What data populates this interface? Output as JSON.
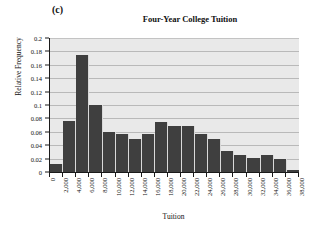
{
  "panel": {
    "label": "(c)"
  },
  "axis_titles": {
    "x": "Tuition",
    "y": "Relative Frequency"
  },
  "chart_data": {
    "type": "bar",
    "title": "Four-Year College Tuition",
    "xlabel": "Tuition",
    "ylabel": "Relative Frequency",
    "ylim": [
      0,
      0.2
    ],
    "grid": true,
    "legend": "none",
    "ytick_labels": [
      "0.2",
      "0.18",
      "0.16",
      "0.14",
      "0.12",
      "0.1",
      "0.08",
      "0.06",
      "0.04",
      "0.02",
      "0"
    ],
    "ytick_values": [
      0.2,
      0.18,
      0.16,
      0.14,
      0.12,
      0.1,
      0.08,
      0.06,
      0.04,
      0.02,
      0
    ],
    "xtick_labels": [
      "0",
      "2,000",
      "4,000",
      "6,000",
      "8,000",
      "10,000",
      "12,000",
      "14,000",
      "16,000",
      "18,000",
      "20,000",
      "22,000",
      "24,000",
      "26,000",
      "28,000",
      "30,000",
      "32,000",
      "34,000",
      "36,000",
      "38,000"
    ],
    "bin_edges": [
      0,
      2000,
      4000,
      6000,
      8000,
      10000,
      12000,
      14000,
      16000,
      18000,
      20000,
      22000,
      24000,
      26000,
      28000,
      30000,
      32000,
      34000,
      36000,
      38000
    ],
    "categories": [
      "0-2,000",
      "2,000-4,000",
      "4,000-6,000",
      "6,000-8,000",
      "8,000-10,000",
      "10,000-12,000",
      "12,000-14,000",
      "14,000-16,000",
      "16,000-18,000",
      "18,000-20,000",
      "20,000-22,000",
      "22,000-24,000",
      "24,000-26,000",
      "26,000-28,000",
      "28,000-30,000",
      "30,000-32,000",
      "32,000-34,000",
      "34,000-36,000",
      "36,000-38,000"
    ],
    "values": [
      0.012,
      0.076,
      0.175,
      0.1,
      0.06,
      0.057,
      0.05,
      0.057,
      0.074,
      0.069,
      0.069,
      0.057,
      0.049,
      0.032,
      0.025,
      0.021,
      0.026,
      0.019,
      0.003
    ],
    "colors": {
      "bar": "#3f3f3f",
      "plot_background": "#e9e9e9",
      "gridline": "#b9b9b9",
      "axis": "#1a1a1a",
      "page_background": "#ffffff"
    }
  }
}
